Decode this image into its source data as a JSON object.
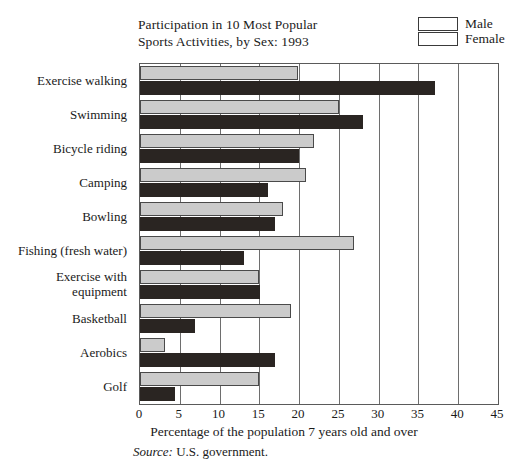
{
  "chart_data": {
    "type": "bar",
    "orientation": "horizontal",
    "title": "Participation in 10 Most Popular\nSports Activities, by Sex: 1993",
    "xlabel": "Percentage of the population 7 years old and over",
    "ylabel": "",
    "xlim": [
      0,
      45
    ],
    "xticks": [
      0,
      5,
      10,
      15,
      20,
      25,
      30,
      35,
      40,
      45
    ],
    "grid": true,
    "grid_axis": "x",
    "legend_position": "top-right",
    "source": "Source: U.S. government.",
    "source_prefix": "Source:",
    "source_text": "U.S. government.",
    "categories": [
      "Exercise walking",
      "Swimming",
      "Bicycle riding",
      "Camping",
      "Bowling",
      "Fishing (fresh water)",
      "Exercise with\nequipment",
      "Basketball",
      "Aerobics",
      "Golf"
    ],
    "series": [
      {
        "name": "Male",
        "color": "#cbcbcb",
        "values": [
          19.8,
          25.0,
          21.9,
          20.9,
          18.0,
          26.9,
          15.0,
          19.0,
          3.1,
          15.0
        ]
      },
      {
        "name": "Female",
        "color": "#2a2522",
        "values": [
          37.1,
          28.0,
          20.0,
          16.1,
          17.0,
          13.1,
          15.1,
          6.9,
          17.0,
          4.4
        ]
      }
    ]
  },
  "legend": {
    "items": [
      {
        "label": "Male",
        "color": "#cbcbcb"
      },
      {
        "label": "Female",
        "color": "#2a2522"
      }
    ]
  }
}
